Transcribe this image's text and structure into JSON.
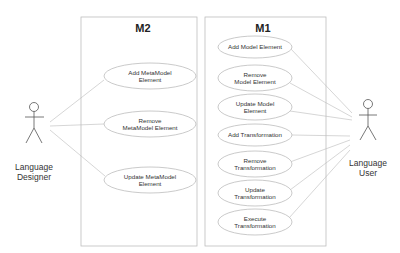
{
  "diagram": {
    "type": "uml-use-case",
    "actors": [
      {
        "id": "designer",
        "label_lines": [
          "Language",
          "Designer"
        ]
      },
      {
        "id": "user",
        "label_lines": [
          "Language",
          "User"
        ]
      }
    ],
    "systems": [
      {
        "id": "m2",
        "title": "M2",
        "use_cases": [
          {
            "id": "add-metamodel-element",
            "lines": [
              "Add MetaModel",
              "Element"
            ]
          },
          {
            "id": "remove-metamodel-element",
            "lines": [
              "Remove",
              "MetaModel Element"
            ]
          },
          {
            "id": "update-metamodel-element",
            "lines": [
              "Update MetaModel",
              "Element"
            ]
          }
        ]
      },
      {
        "id": "m1",
        "title": "M1",
        "use_cases": [
          {
            "id": "add-model-element",
            "lines": [
              "Add Model Element"
            ]
          },
          {
            "id": "remove-model-element",
            "lines": [
              "Remove",
              "Model Element"
            ]
          },
          {
            "id": "update-model-element",
            "lines": [
              "Update Model",
              "Element"
            ]
          },
          {
            "id": "add-transformation",
            "lines": [
              "Add Transformation"
            ]
          },
          {
            "id": "remove-transformation",
            "lines": [
              "Remove",
              "Transformation"
            ]
          },
          {
            "id": "update-transformation",
            "lines": [
              "Update",
              "Transformation"
            ]
          },
          {
            "id": "execute-transformation",
            "lines": [
              "Execute",
              "Transformation"
            ]
          }
        ]
      }
    ],
    "associations": [
      [
        "designer",
        "add-metamodel-element"
      ],
      [
        "designer",
        "remove-metamodel-element"
      ],
      [
        "designer",
        "update-metamodel-element"
      ],
      [
        "user",
        "add-model-element"
      ],
      [
        "user",
        "remove-model-element"
      ],
      [
        "user",
        "update-model-element"
      ],
      [
        "user",
        "add-transformation"
      ],
      [
        "user",
        "remove-transformation"
      ],
      [
        "user",
        "update-transformation"
      ],
      [
        "user",
        "execute-transformation"
      ]
    ]
  }
}
